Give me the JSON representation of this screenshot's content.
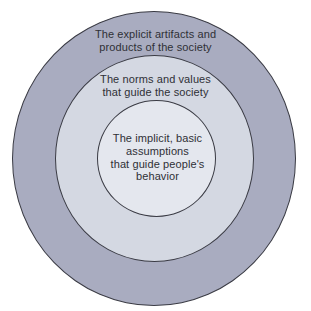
{
  "diagram": {
    "type": "concentric-circles",
    "layers": [
      {
        "id": "outer",
        "label_lines": [
          "The explicit artifacts and",
          "products of the society"
        ],
        "fill": "#a9acc0"
      },
      {
        "id": "middle",
        "label_lines": [
          "The norms and values",
          "that guide the society"
        ],
        "fill": "#d4d8e2"
      },
      {
        "id": "inner",
        "label_lines": [
          "The implicit, basic",
          "assumptions",
          "that guide people's",
          "behavior"
        ],
        "fill": "#e4e7ee"
      }
    ],
    "stroke": "#3a3b44",
    "text_color": "#2f3036"
  }
}
